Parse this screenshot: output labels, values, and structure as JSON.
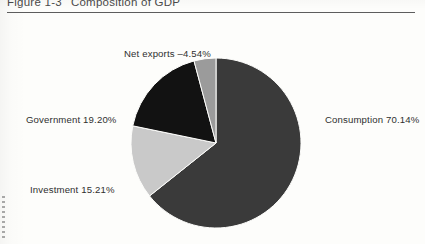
{
  "caption": {
    "figure_number": "Figure 1-3",
    "title": "Composition of GDP"
  },
  "chart_data": {
    "type": "pie",
    "title": "Composition of GDP",
    "xlabel": "",
    "ylabel": "",
    "legend_position": "callout-labels",
    "grid": false,
    "units": "percent of GDP",
    "start_angle_deg": 0,
    "direction": "clockwise",
    "categories": [
      "Consumption",
      "Investment",
      "Government",
      "Net exports"
    ],
    "values": [
      70.14,
      15.21,
      19.2,
      -4.54
    ],
    "slices": [
      {
        "name": "Consumption",
        "label": "Consumption 70.14%",
        "value": 70.14,
        "value_text": "70.14%",
        "color": "#3a3a3a",
        "sweep_deg": 252.5,
        "label_side": "right"
      },
      {
        "name": "Investment",
        "label": "Investment 15.21%",
        "value": 15.21,
        "value_text": "15.21%",
        "color": "#c9c9c9",
        "sweep_deg": 54.8,
        "label_side": "left"
      },
      {
        "name": "Government",
        "label": "Government 19.20%",
        "value": 19.2,
        "value_text": "19.20%",
        "color": "#121212",
        "sweep_deg": 69.1,
        "label_side": "left"
      },
      {
        "name": "Net exports",
        "label": "Net exports –4.54%",
        "value": -4.54,
        "value_text": "–4.54%",
        "color": "#9b9b9b",
        "sweep_deg": 16.3,
        "label_side": "top"
      }
    ],
    "geometry": {
      "center_x": 216,
      "center_y": 127,
      "radius": 85
    },
    "colors": {
      "consumption": "#3a3a3a",
      "investment": "#c9c9c9",
      "government": "#121212",
      "net_exports": "#9b9b9b",
      "page_background": "#fdfdfb",
      "rule": "#5d5d5d",
      "text": "#2f2f2f",
      "caption_text": "#4a4a4a"
    }
  }
}
